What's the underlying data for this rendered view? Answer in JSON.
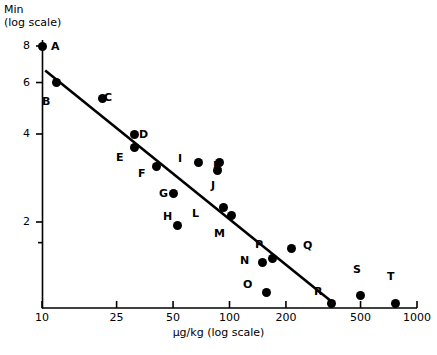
{
  "chart_data": {
    "type": "scatter",
    "title": "",
    "xlabel": "µg/kg (log scale)",
    "ylabel": "Min\n(log scale)",
    "ylabel_line1": "Min",
    "ylabel_line2": "(log scale)",
    "xscale": "log",
    "yscale": "log",
    "xlim": [
      10,
      1000
    ],
    "ylim": [
      1.55,
      8.6
    ],
    "xticks": [
      10,
      25,
      50,
      100,
      200,
      500,
      1000
    ],
    "xtick_labels": [
      "10",
      "25",
      "50",
      "100",
      "200",
      "500",
      "1000"
    ],
    "yticks": [
      8,
      6,
      4,
      2
    ],
    "ytick_labels": [
      "8",
      "6",
      "4",
      "2"
    ],
    "yminor_ticks": [
      1.7
    ],
    "grid": false,
    "legend": false,
    "points": [
      {
        "label": "A",
        "x": 10,
        "y": 8.0,
        "px": 42,
        "py": 46,
        "lx": 51,
        "ly": 41
      },
      {
        "label": "B",
        "x": 12,
        "y": 6.0,
        "px": 50,
        "py": 88,
        "lx": 42,
        "ly": 96
      },
      {
        "label": "C",
        "x": 21,
        "y": 5.3,
        "px": 94,
        "py": 97,
        "lx": 104,
        "ly": 92
      },
      {
        "label": "D",
        "x": 31,
        "y": 4.0,
        "px": 129,
        "py": 133,
        "lx": 139,
        "ly": 129
      },
      {
        "label": "E",
        "x": 31,
        "y": 3.6,
        "px": 129,
        "py": 151,
        "lx": 116,
        "ly": 152
      },
      {
        "label": "F",
        "x": 41,
        "y": 3.1,
        "px": 152,
        "py": 170,
        "lx": 138,
        "ly": 168
      },
      {
        "label": "G",
        "x": 50,
        "y": 2.5,
        "px": 163,
        "py": 202,
        "lx": 159,
        "ly": 188
      },
      {
        "label": "H",
        "x": 53,
        "y": 1.95,
        "px": 168,
        "py": 225,
        "lx": 163,
        "ly": 211
      },
      {
        "label": "I",
        "x": 68,
        "y": 3.2,
        "px": 180,
        "py": 168,
        "lx": 178,
        "ly": 153
      },
      {
        "label": "J",
        "x": 86,
        "y": 3.0,
        "px": 201,
        "py": 177,
        "lx": 211,
        "ly": 180
      },
      {
        "label": "K",
        "x": 88,
        "y": 3.2,
        "px": 203,
        "py": 166,
        "lx": 213,
        "ly": 160
      },
      {
        "label": "L",
        "x": 93,
        "y": 2.25,
        "px": 208,
        "py": 210,
        "lx": 192,
        "ly": 208
      },
      {
        "label": "M",
        "x": 102,
        "y": 2.1,
        "px": 217,
        "py": 218,
        "lx": 214,
        "ly": 228
      },
      {
        "label": "N",
        "x": 150,
        "y": 1.45,
        "px": 255,
        "py": 257,
        "lx": 240,
        "ly": 255
      },
      {
        "label": "O",
        "x": 158,
        "y": 1.15,
        "px": 259,
        "py": 281,
        "lx": 243,
        "ly": 279
      },
      {
        "label": "P",
        "x": 170,
        "y": 1.5,
        "px": 266,
        "py": 252,
        "lx": 255,
        "ly": 239
      },
      {
        "label": "Q",
        "x": 215,
        "y": 1.62,
        "px": 293,
        "py": 245,
        "lx": 303,
        "ly": 240
      },
      {
        "label": "R",
        "x": 350,
        "y": 1.05,
        "px": 330,
        "py": 287,
        "lx": 314,
        "ly": 286
      },
      {
        "label": "S",
        "x": 500,
        "y": 1.12,
        "px": 356,
        "py": 280,
        "lx": 353,
        "ly": 264
      },
      {
        "label": "T",
        "x": 770,
        "y": 1.05,
        "px": 390,
        "py": 287,
        "lx": 387,
        "ly": 271
      }
    ],
    "trendline": {
      "x_start": 10.4,
      "y_start": 6.6,
      "x_end": 350,
      "y_end": 1.07,
      "px1": 43,
      "py1": 74,
      "px2": 331,
      "py2": 286
    }
  }
}
